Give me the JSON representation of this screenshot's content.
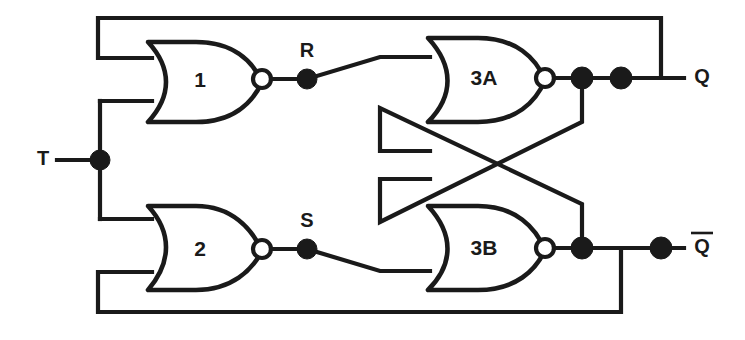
{
  "figure": {
    "kind": "logic-circuit-diagram",
    "background_color": "#ffffff",
    "ink_color": "#1a1a1a"
  },
  "gates": [
    {
      "id": "gate-1",
      "label": "1",
      "type": "NOR",
      "inputs": 2,
      "label_x": 200,
      "label_y": 81
    },
    {
      "id": "gate-2",
      "label": "2",
      "type": "NOR",
      "inputs": 2,
      "label_x": 200,
      "label_y": 250
    },
    {
      "id": "gate-3a",
      "label": "3A",
      "type": "NOR",
      "inputs": 2,
      "label_x": 484,
      "label_y": 79
    },
    {
      "id": "gate-3b",
      "label": "3B",
      "type": "NOR",
      "inputs": 2,
      "label_x": 484,
      "label_y": 249
    }
  ],
  "nodes": [
    {
      "id": "node-r",
      "label": "R",
      "x": 307,
      "y": 52
    },
    {
      "id": "node-s",
      "label": "S",
      "x": 307,
      "y": 222
    }
  ],
  "ports": [
    {
      "id": "port-t",
      "label": "T",
      "x": 43,
      "y": 160,
      "kind": "input",
      "overbar": false
    },
    {
      "id": "port-q",
      "label": "Q",
      "x": 702,
      "y": 78,
      "kind": "output",
      "overbar": false
    },
    {
      "id": "port-qbar",
      "label": "Q",
      "x": 702,
      "y": 248,
      "kind": "output",
      "overbar": true
    }
  ],
  "junction_dots": [
    {
      "id": "dot-t",
      "x": 100,
      "y": 160,
      "r": 10
    },
    {
      "id": "dot-r",
      "x": 307,
      "y": 79,
      "r": 10
    },
    {
      "id": "dot-s",
      "x": 307,
      "y": 249,
      "r": 10
    },
    {
      "id": "dot-q-a",
      "x": 582,
      "y": 78,
      "r": 11
    },
    {
      "id": "dot-q-b",
      "x": 621,
      "y": 78,
      "r": 11
    },
    {
      "id": "dot-qbar-a",
      "x": 582,
      "y": 248,
      "r": 11
    },
    {
      "id": "dot-qbar-b",
      "x": 661,
      "y": 248,
      "r": 11
    }
  ],
  "bubbles": [
    {
      "id": "bubble-1",
      "x": 262,
      "y": 79,
      "r": 9
    },
    {
      "id": "bubble-2",
      "x": 262,
      "y": 249,
      "r": 9
    },
    {
      "id": "bubble-3a",
      "x": 545,
      "y": 78,
      "r": 9
    },
    {
      "id": "bubble-3b",
      "x": 545,
      "y": 248,
      "r": 9
    }
  ]
}
